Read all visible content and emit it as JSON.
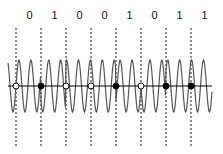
{
  "diagram": {
    "type": "binary phase modulated waveform",
    "bits": [
      "0",
      "1",
      "0",
      "0",
      "1",
      "0",
      "1",
      "1"
    ],
    "symbol_boundaries_x": [
      16,
      41,
      66,
      91,
      116,
      141,
      166,
      191
    ],
    "marker_legend": {
      "0": "open-circle",
      "1": "filled-circle"
    },
    "axis_y": 86,
    "wave_amplitude": 26,
    "wave_cycles_per_symbol": 2,
    "colors": {
      "wave": "#555555",
      "axis": "#000000",
      "dash": "#000000",
      "marker": "#000000"
    }
  }
}
